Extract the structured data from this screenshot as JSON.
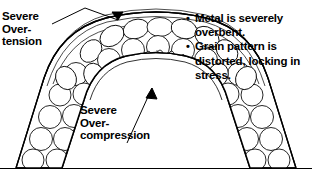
{
  "diagram": {
    "type": "technical-illustration",
    "line_color": "#000000",
    "background_color": "#ffffff"
  },
  "labels": {
    "tension": {
      "name": "severe-overtension",
      "lines": [
        "Severe",
        "Over-",
        "tension"
      ],
      "text": "Severe\nOver-\ntension",
      "points_to": "outer surface of arch crown"
    },
    "compression": {
      "name": "severe-overcompression",
      "lines": [
        "Severe",
        "Over-",
        "compression"
      ],
      "text": "Severe\nOver-\ncompression",
      "points_to": "inner surface of arch crown"
    }
  },
  "bullets": [
    {
      "marker": "•",
      "text": "Metal is severely overbent."
    },
    {
      "marker": "•",
      "text": "Grain pattern is distorted, locking in stress."
    }
  ],
  "figure": {
    "outer_arch": "inverted-U band",
    "inner_arch": "small arch opening at crown",
    "grain_fill": "packed circles and ellipses",
    "radial_grains": "elongated grains converging at inner crown",
    "tension_arrow": "arrowhead pointing down at outer crown",
    "compression_arrow": "arrowhead pointing up at inner crown",
    "base_line": "horizontal rule across bottom"
  }
}
